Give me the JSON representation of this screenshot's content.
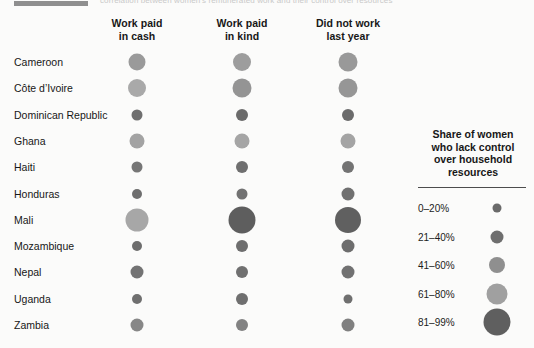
{
  "title_strip": {
    "text": "correlation between women's remunerated work and their control over resources"
  },
  "chart_data": {
    "type": "bubble",
    "title": "",
    "xlabel": "",
    "ylabel": "",
    "columns": [
      {
        "line1": "Work paid",
        "line2": "in cash"
      },
      {
        "line1": "Work paid",
        "line2": "in kind"
      },
      {
        "line1": "Did not work",
        "line2": "last year"
      }
    ],
    "categories": [
      "Cameroon",
      "Côte d’Ivoire",
      "Dominican Republic",
      "Ghana",
      "Haiti",
      "Honduras",
      "Mali",
      "Mozambique",
      "Nepal",
      "Uganda",
      "Zambia"
    ],
    "series": [
      {
        "name": "Work paid in cash",
        "points": [
          {
            "category": "Cameroon",
            "size": 17,
            "band": "41–60%",
            "color": "#9a9a9a"
          },
          {
            "category": "Côte d’Ivoire",
            "size": 18,
            "band": "61–80%",
            "color": "#a9a9a9"
          },
          {
            "category": "Dominican Republic",
            "size": 11,
            "band": "21–40%",
            "color": "#6f6f6f"
          },
          {
            "category": "Ghana",
            "size": 15,
            "band": "61–80%",
            "color": "#a3a3a3"
          },
          {
            "category": "Haiti",
            "size": 11,
            "band": "21–40%",
            "color": "#767676"
          },
          {
            "category": "Honduras",
            "size": 10,
            "band": "21–40%",
            "color": "#6e6e6e"
          },
          {
            "category": "Mali",
            "size": 23,
            "band": "61–80%",
            "color": "#a7a7a7"
          },
          {
            "category": "Mozambique",
            "size": 10,
            "band": "21–40%",
            "color": "#6d6d6d"
          },
          {
            "category": "Nepal",
            "size": 13,
            "band": "21–40%",
            "color": "#737373"
          },
          {
            "category": "Uganda",
            "size": 10,
            "band": "21–40%",
            "color": "#6f6f6f"
          },
          {
            "category": "Zambia",
            "size": 13,
            "band": "41–60%",
            "color": "#878787"
          }
        ]
      },
      {
        "name": "Work paid in kind",
        "points": [
          {
            "category": "Cameroon",
            "size": 18,
            "band": "41–60%",
            "color": "#9d9d9d"
          },
          {
            "category": "Côte d’Ivoire",
            "size": 19,
            "band": "41–60%",
            "color": "#949494"
          },
          {
            "category": "Dominican Republic",
            "size": 12,
            "band": "21–40%",
            "color": "#6b6b6b"
          },
          {
            "category": "Ghana",
            "size": 15,
            "band": "61–80%",
            "color": "#a5a5a5"
          },
          {
            "category": "Haiti",
            "size": 12,
            "band": "21–40%",
            "color": "#6f6f6f"
          },
          {
            "category": "Honduras",
            "size": 11,
            "band": "21–40%",
            "color": "#727272"
          },
          {
            "category": "Mali",
            "size": 27,
            "band": "81–99%",
            "color": "#5e5e5e"
          },
          {
            "category": "Mozambique",
            "size": 12,
            "band": "21–40%",
            "color": "#6e6e6e"
          },
          {
            "category": "Nepal",
            "size": 12,
            "band": "21–40%",
            "color": "#707070"
          },
          {
            "category": "Uganda",
            "size": 12,
            "band": "21–40%",
            "color": "#6f6f6f"
          },
          {
            "category": "Zambia",
            "size": 12,
            "band": "41–60%",
            "color": "#828282"
          }
        ]
      },
      {
        "name": "Did not work last year",
        "points": [
          {
            "category": "Cameroon",
            "size": 19,
            "band": "41–60%",
            "color": "#999999"
          },
          {
            "category": "Côte d’Ivoire",
            "size": 19,
            "band": "41–60%",
            "color": "#969696"
          },
          {
            "category": "Dominican Republic",
            "size": 12,
            "band": "21–40%",
            "color": "#6b6b6b"
          },
          {
            "category": "Ghana",
            "size": 15,
            "band": "61–80%",
            "color": "#a4a4a4"
          },
          {
            "category": "Haiti",
            "size": 12,
            "band": "21–40%",
            "color": "#737373"
          },
          {
            "category": "Honduras",
            "size": 13,
            "band": "21–40%",
            "color": "#707070"
          },
          {
            "category": "Mali",
            "size": 26,
            "band": "81–99%",
            "color": "#606060"
          },
          {
            "category": "Mozambique",
            "size": 13,
            "band": "21–40%",
            "color": "#6d6d6d"
          },
          {
            "category": "Nepal",
            "size": 13,
            "band": "21–40%",
            "color": "#717171"
          },
          {
            "category": "Uganda",
            "size": 9,
            "band": "21–40%",
            "color": "#6f6f6f"
          },
          {
            "category": "Zambia",
            "size": 13,
            "band": "41–60%",
            "color": "#808080"
          }
        ]
      }
    ],
    "legend": {
      "position": "right",
      "title_lines": [
        "Share of women",
        "who lack control",
        "over household",
        "resources"
      ],
      "items": [
        {
          "label": "0–20%",
          "size": 9,
          "color": "#6a6a6a"
        },
        {
          "label": "21–40%",
          "size": 13,
          "color": "#6e6e6e"
        },
        {
          "label": "41–60%",
          "size": 16,
          "color": "#8f8f8f"
        },
        {
          "label": "61–80%",
          "size": 21,
          "color": "#a0a0a0"
        },
        {
          "label": "81–99%",
          "size": 27,
          "color": "#5f5f5f"
        }
      ]
    }
  }
}
